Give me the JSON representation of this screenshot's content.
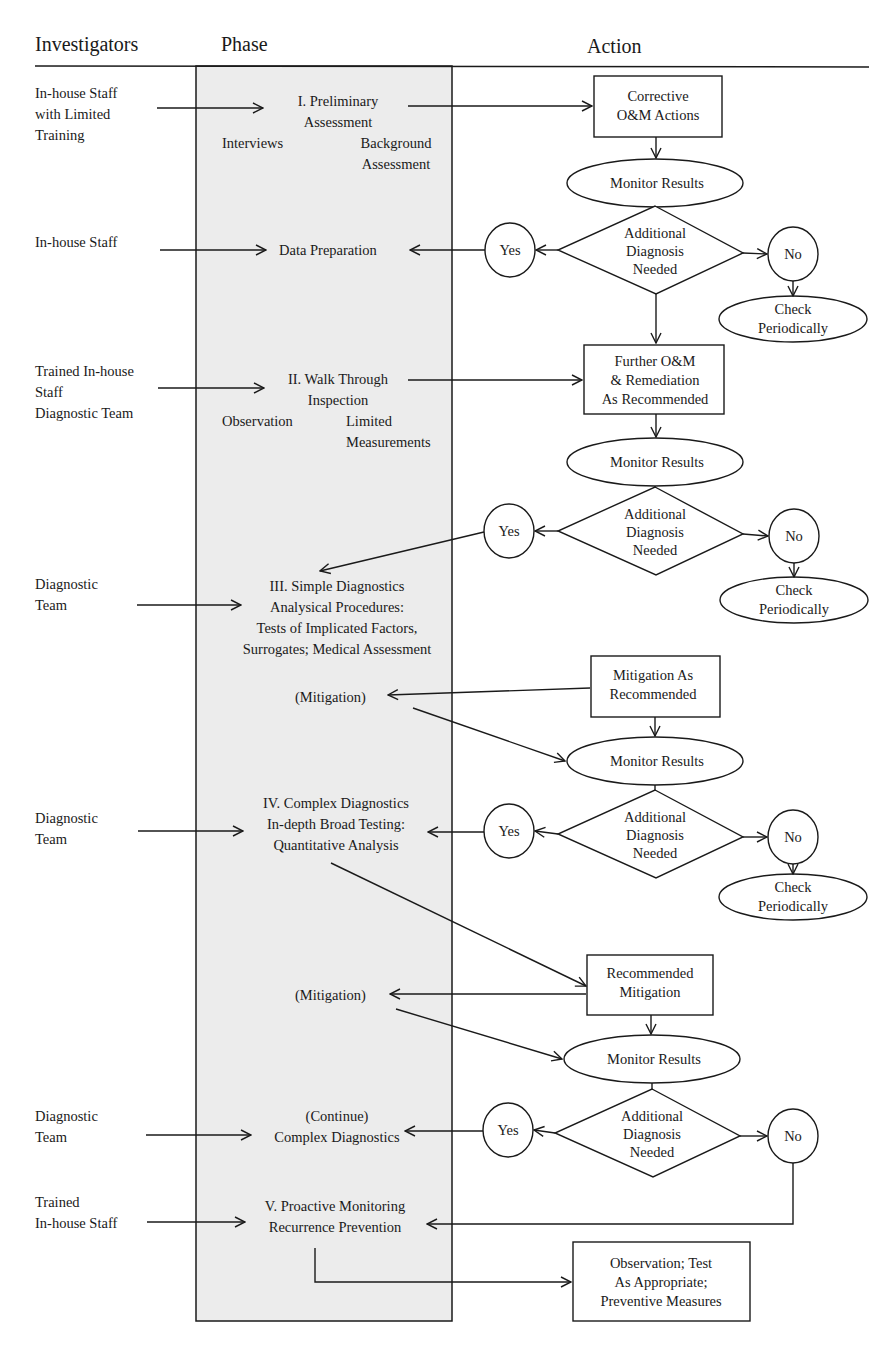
{
  "headers": {
    "investigators": "Investigators",
    "phase": "Phase",
    "action": "Action"
  },
  "investigators": [
    {
      "lines": [
        "In-house Staff",
        "with Limited",
        "Training"
      ]
    },
    {
      "lines": [
        "In-house Staff"
      ]
    },
    {
      "lines": [
        "Trained In-house",
        "Staff",
        "Diagnostic Team"
      ]
    },
    {
      "lines": [
        "Diagnostic",
        "Team"
      ]
    },
    {
      "lines": [
        "Diagnostic",
        "Team"
      ]
    },
    {
      "lines": [
        "Diagnostic",
        "Team"
      ]
    },
    {
      "lines": [
        "Trained",
        "In-house Staff"
      ]
    }
  ],
  "phases": {
    "p1": {
      "title": [
        "I. Preliminary",
        "Assessment"
      ],
      "sub_left": "Interviews",
      "sub_right": [
        "Background",
        "Assessment"
      ]
    },
    "data_prep": "Data Preparation",
    "p2": {
      "title": [
        "II. Walk Through",
        "Inspection"
      ],
      "sub_left": "Observation",
      "sub_right": [
        "Limited",
        "Measurements"
      ]
    },
    "p3": [
      "III. Simple Diagnostics",
      "Analysical Procedures:",
      "Tests of Implicated Factors,",
      "Surrogates; Medical Assessment"
    ],
    "mitigation1": "(Mitigation)",
    "p4": [
      "IV. Complex Diagnostics",
      "In-depth Broad Testing:",
      "Quantitative Analysis"
    ],
    "mitigation2": "(Mitigation)",
    "continue": [
      "(Continue)",
      "Complex Diagnostics"
    ],
    "p5": [
      "V. Proactive Monitoring",
      "Recurrence Prevention"
    ]
  },
  "actions": {
    "box1": [
      "Corrective",
      "O&M Actions"
    ],
    "box2": [
      "Further O&M",
      "& Remediation",
      "As Recommended"
    ],
    "box3": [
      "Mitigation As",
      "Recommended"
    ],
    "box4": [
      "Recommended",
      "Mitigation"
    ],
    "box5": [
      "Observation; Test",
      "As Appropriate;",
      "Preventive Measures"
    ],
    "monitor": "Monitor Results",
    "decision": [
      "Additional",
      "Diagnosis",
      "Needed"
    ],
    "yes": "Yes",
    "no": "No",
    "check": [
      "Check",
      "Periodically"
    ]
  },
  "colors": {
    "phase_column_fill": "#ececec",
    "line": "#1a1a1a"
  }
}
